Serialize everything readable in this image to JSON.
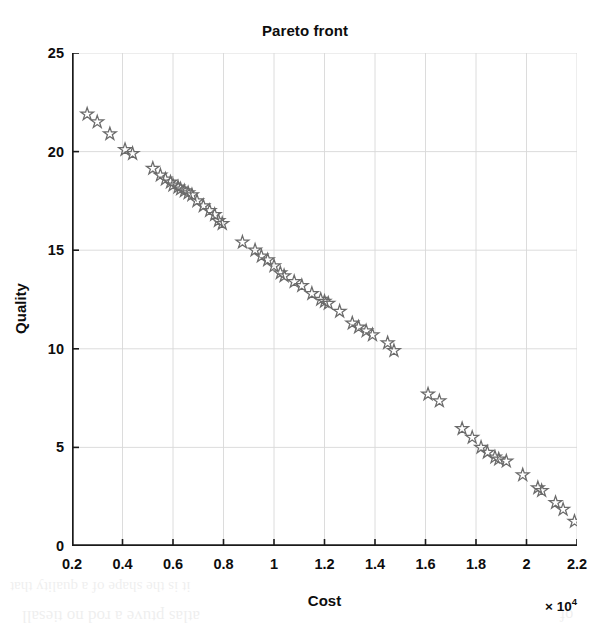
{
  "figure": {
    "background_color": "#ffffff",
    "title": "Pareto front",
    "title_color": "#0d0d0d"
  },
  "axes": {
    "x": {
      "label": "Cost",
      "exponent_prefix": "× 10",
      "exponent_power": "4",
      "tick_labels": [
        "0.2",
        "0.4",
        "0.6",
        "0.8",
        "1",
        "1.2",
        "1.4",
        "1.6",
        "1.8",
        "2",
        "2.2"
      ],
      "tick_values": [
        0.2,
        0.4,
        0.6,
        0.8,
        1.0,
        1.2,
        1.4,
        1.6,
        1.8,
        2.0,
        2.2
      ],
      "limits": [
        0.2,
        2.2
      ],
      "multiplier": 10000
    },
    "y": {
      "label": "Quality",
      "tick_labels": [
        "0",
        "5",
        "10",
        "15",
        "20",
        "25"
      ],
      "tick_values": [
        0,
        5,
        10,
        15,
        20,
        25
      ],
      "limits": [
        0,
        25
      ]
    },
    "axis_color": "#1a1a1a",
    "grid_color": "#d8d8d8",
    "grid_on": true,
    "box": false
  },
  "marker": {
    "shape": "star-pentagram-outline",
    "edge_color": "#6b6b6b",
    "fill_color": "none",
    "size": 11
  },
  "bleed_through": [
    {
      "text": "it  is  the  shape  of  a  quality  that",
      "x": 10,
      "y": 578,
      "size": 15,
      "rotate": 180
    },
    {
      "text": "atlas  ptuve  a  rod  no  tiesall",
      "x": 22,
      "y": 606,
      "size": 17,
      "rotate": 180
    },
    {
      "text": "of",
      "x": 560,
      "y": 606,
      "size": 16,
      "rotate": 180
    }
  ],
  "chart_data": {
    "type": "scatter",
    "title": "Pareto front",
    "xlabel": "Cost",
    "ylabel": "Quality",
    "xlim": [
      0.2,
      2.2
    ],
    "ylim": [
      0,
      25
    ],
    "x_multiplier": 10000,
    "grid": true,
    "legend": null,
    "series": [
      {
        "name": "Pareto front",
        "marker": "star",
        "color": "#6b6b6b",
        "x": [
          0.26,
          0.3,
          0.35,
          0.41,
          0.44,
          0.52,
          0.55,
          0.57,
          0.59,
          0.6,
          0.62,
          0.63,
          0.645,
          0.66,
          0.675,
          0.695,
          0.72,
          0.745,
          0.765,
          0.78,
          0.795,
          0.875,
          0.925,
          0.95,
          0.975,
          1.0,
          1.025,
          1.04,
          1.08,
          1.11,
          1.15,
          1.185,
          1.2,
          1.215,
          1.26,
          1.31,
          1.335,
          1.365,
          1.39,
          1.45,
          1.475,
          1.61,
          1.655,
          1.745,
          1.785,
          1.82,
          1.845,
          1.875,
          1.89,
          1.92,
          1.985,
          2.045,
          2.06,
          2.115,
          2.145,
          2.19
        ],
        "y": [
          21.9,
          21.5,
          20.9,
          20.1,
          19.9,
          19.15,
          18.8,
          18.6,
          18.45,
          18.3,
          18.2,
          18.1,
          18.0,
          17.9,
          17.8,
          17.5,
          17.25,
          17.0,
          16.8,
          16.5,
          16.35,
          15.4,
          15.0,
          14.7,
          14.5,
          14.2,
          13.85,
          13.7,
          13.4,
          13.2,
          12.8,
          12.5,
          12.4,
          12.3,
          11.9,
          11.3,
          11.1,
          10.9,
          10.7,
          10.3,
          9.9,
          7.7,
          7.35,
          5.95,
          5.5,
          5.0,
          4.75,
          4.5,
          4.4,
          4.3,
          3.6,
          2.95,
          2.8,
          2.2,
          1.85,
          1.25
        ]
      }
    ]
  }
}
